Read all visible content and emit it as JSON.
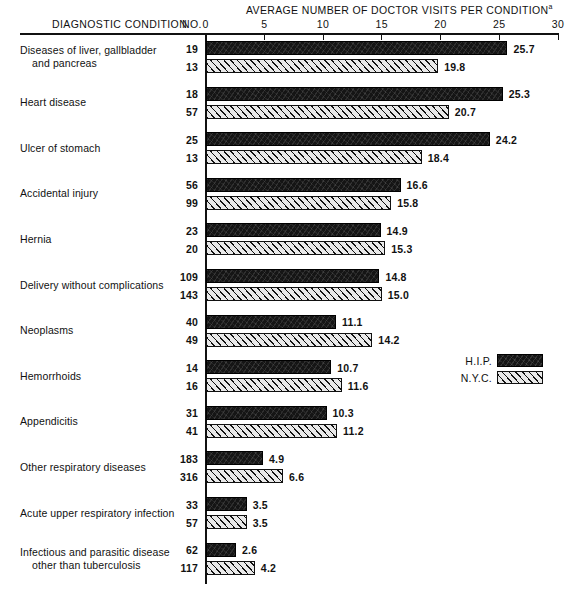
{
  "header": {
    "axis_title": "AVERAGE NUMBER OF DOCTOR VISITS PER CONDITION",
    "axis_title_footnote_marker": "a",
    "column_condition": "DIAGNOSTIC CONDITION",
    "column_number": "NO."
  },
  "legend": {
    "position": "right-middle",
    "entries": [
      {
        "label": "H.I.P.",
        "pattern": "solid-black",
        "color": "#151515"
      },
      {
        "label": "N.Y.C.",
        "pattern": "diagonal-hatch",
        "color": "#e9e9e9"
      }
    ]
  },
  "chart_data": {
    "type": "bar",
    "orientation": "horizontal",
    "title": "AVERAGE NUMBER OF DOCTOR VISITS PER CONDITION",
    "xlabel": "AVERAGE NUMBER OF DOCTOR VISITS PER CONDITION",
    "ylabel": "DIAGNOSTIC CONDITION",
    "xlim": [
      0,
      30
    ],
    "xticks": [
      0,
      5,
      10,
      15,
      20,
      25,
      30
    ],
    "xtick_labels": [
      "0",
      "5",
      "10",
      "15",
      "20",
      "25",
      "30"
    ],
    "grid": false,
    "legend_position": "middle right",
    "series": [
      {
        "name": "H.I.P.",
        "values": [
          25.7,
          25.3,
          24.2,
          16.6,
          14.9,
          14.8,
          11.1,
          10.7,
          10.3,
          4.9,
          3.5,
          2.6
        ]
      },
      {
        "name": "N.Y.C.",
        "values": [
          19.8,
          20.7,
          18.4,
          15.8,
          15.3,
          15.0,
          14.2,
          11.6,
          11.2,
          6.6,
          3.5,
          4.2
        ]
      }
    ],
    "counts": {
      "H.I.P.": [
        19,
        18,
        25,
        56,
        23,
        109,
        40,
        14,
        31,
        183,
        33,
        62
      ],
      "N.Y.C.": [
        13,
        57,
        13,
        99,
        20,
        143,
        49,
        16,
        41,
        316,
        57,
        117
      ]
    },
    "categories": [
      "Diseases of liver, gallbladder and pancreas",
      "Heart disease",
      "Ulcer of stomach",
      "Accidental injury",
      "Hernia",
      "Delivery without complications",
      "Neoplasms",
      "Hemorrhoids",
      "Appendicitis",
      "Other respiratory diseases",
      "Acute upper respiratory infection",
      "Infectious and parasitic disease other than tuberculosis"
    ]
  },
  "rows": [
    {
      "label_line1": "Diseases of liver, gallbladder",
      "label_line2": "    and pancreas",
      "hip_count": "19",
      "hip_value": "25.7",
      "hip_num": 25.7,
      "nyc_count": "13",
      "nyc_value": "19.8",
      "nyc_num": 19.8
    },
    {
      "label_line1": "Heart disease",
      "label_line2": "",
      "hip_count": "18",
      "hip_value": "25.3",
      "hip_num": 25.3,
      "nyc_count": "57",
      "nyc_value": "20.7",
      "nyc_num": 20.7
    },
    {
      "label_line1": "Ulcer of stomach",
      "label_line2": "",
      "hip_count": "25",
      "hip_value": "24.2",
      "hip_num": 24.2,
      "nyc_count": "13",
      "nyc_value": "18.4",
      "nyc_num": 18.4
    },
    {
      "label_line1": "Accidental injury",
      "label_line2": "",
      "hip_count": "56",
      "hip_value": "16.6",
      "hip_num": 16.6,
      "nyc_count": "99",
      "nyc_value": "15.8",
      "nyc_num": 15.8
    },
    {
      "label_line1": "Hernia",
      "label_line2": "",
      "hip_count": "23",
      "hip_value": "14.9",
      "hip_num": 14.9,
      "nyc_count": "20",
      "nyc_value": "15.3",
      "nyc_num": 15.3
    },
    {
      "label_line1": "Delivery without complications",
      "label_line2": "",
      "hip_count": "109",
      "hip_value": "14.8",
      "hip_num": 14.8,
      "nyc_count": "143",
      "nyc_value": "15.0",
      "nyc_num": 15.0
    },
    {
      "label_line1": "Neoplasms",
      "label_line2": "",
      "hip_count": "40",
      "hip_value": "11.1",
      "hip_num": 11.1,
      "nyc_count": "49",
      "nyc_value": "14.2",
      "nyc_num": 14.2
    },
    {
      "label_line1": "Hemorrhoids",
      "label_line2": "",
      "hip_count": "14",
      "hip_value": "10.7",
      "hip_num": 10.7,
      "nyc_count": "16",
      "nyc_value": "11.6",
      "nyc_num": 11.6
    },
    {
      "label_line1": "Appendicitis",
      "label_line2": "",
      "hip_count": "31",
      "hip_value": "10.3",
      "hip_num": 10.3,
      "nyc_count": "41",
      "nyc_value": "11.2",
      "nyc_num": 11.2
    },
    {
      "label_line1": "Other respiratory diseases",
      "label_line2": "",
      "hip_count": "183",
      "hip_value": "4.9",
      "hip_num": 4.9,
      "nyc_count": "316",
      "nyc_value": "6.6",
      "nyc_num": 6.6
    },
    {
      "label_line1": "Acute upper respiratory infection",
      "label_line2": "",
      "hip_count": "33",
      "hip_value": "3.5",
      "hip_num": 3.5,
      "nyc_count": "57",
      "nyc_value": "3.5",
      "nyc_num": 3.5
    },
    {
      "label_line1": "Infectious and parasitic disease",
      "label_line2": "    other than tuberculosis",
      "hip_count": "62",
      "hip_value": "2.6",
      "hip_num": 2.6,
      "nyc_count": "117",
      "nyc_value": "4.2",
      "nyc_num": 4.2
    }
  ]
}
